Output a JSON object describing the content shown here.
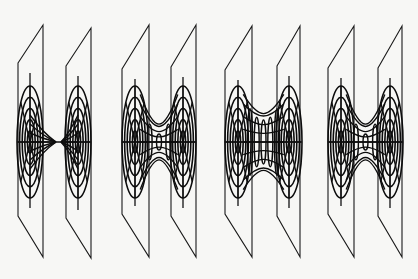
{
  "canvas": {
    "width": 418,
    "height": 279,
    "background": "#f7f7f5",
    "ink": "#0d0d0d"
  },
  "figure": {
    "panels": [
      {
        "id": "panel-1",
        "throat_type": "pinched-cones",
        "axis_y": 142,
        "throat_half_height": 0,
        "left_plane": {
          "top_left": [
            18,
            63
          ],
          "top_right": [
            43,
            25
          ],
          "bottom_left": [
            18,
            216
          ],
          "bottom_right": [
            43,
            257
          ],
          "center_x": 30,
          "tip_x": 56
        },
        "right_plane": {
          "top_left": [
            66,
            66
          ],
          "top_right": [
            91,
            28
          ],
          "bottom_left": [
            66,
            218
          ],
          "bottom_right": [
            91,
            258
          ],
          "center_x": 78,
          "tip_x": 61
        }
      },
      {
        "id": "panel-2",
        "throat_type": "narrow-throat",
        "axis_y": 142,
        "throat_half_height": 8,
        "left_plane": {
          "top_left": [
            122,
            69
          ],
          "top_right": [
            149,
            25
          ],
          "bottom_left": [
            122,
            214
          ],
          "bottom_right": [
            149,
            257
          ],
          "center_x": 135
        },
        "right_plane": {
          "top_left": [
            171,
            67
          ],
          "top_right": [
            196,
            25
          ],
          "bottom_left": [
            171,
            216
          ],
          "bottom_right": [
            196,
            257
          ],
          "center_x": 183
        }
      },
      {
        "id": "panel-3",
        "throat_type": "wide-throat",
        "axis_y": 142,
        "throat_half_height": 22,
        "left_plane": {
          "top_left": [
            225,
            70
          ],
          "top_right": [
            252,
            26
          ],
          "bottom_left": [
            225,
            214
          ],
          "bottom_right": [
            252,
            257
          ],
          "center_x": 238
        },
        "right_plane": {
          "top_left": [
            277,
            66
          ],
          "top_right": [
            300,
            26
          ],
          "bottom_left": [
            277,
            216
          ],
          "bottom_right": [
            300,
            257
          ],
          "center_x": 289
        }
      },
      {
        "id": "panel-4",
        "throat_type": "narrow-throat",
        "axis_y": 142,
        "throat_half_height": 8,
        "left_plane": {
          "top_left": [
            328,
            68
          ],
          "top_right": [
            354,
            26
          ],
          "bottom_left": [
            328,
            214
          ],
          "bottom_right": [
            354,
            257
          ],
          "center_x": 341
        },
        "right_plane": {
          "top_left": [
            378,
            68
          ],
          "top_right": [
            402,
            26
          ],
          "bottom_left": [
            378,
            216
          ],
          "bottom_right": [
            402,
            257
          ],
          "center_x": 390
        }
      }
    ],
    "rings": {
      "count": 5,
      "max_rx": 13,
      "max_ry": 56
    },
    "spokes": 8
  }
}
